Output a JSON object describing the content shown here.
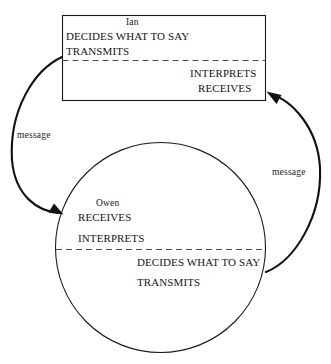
{
  "diagram": {
    "type": "communication-cycle",
    "background_color": "#ffffff",
    "line_color": "#1a1a1a",
    "text_color": "#141414"
  },
  "sender_box": {
    "shape": "rectangle",
    "person_name": "Ian",
    "upper_half": {
      "actions": [
        "DECIDES WHAT TO SAY",
        "TRANSMITS"
      ]
    },
    "lower_half": {
      "actions": [
        "INTERPRETS",
        "RECEIVES"
      ]
    },
    "divider": "dashed"
  },
  "receiver_circle": {
    "shape": "circle",
    "person_name": "Owen",
    "upper_half": {
      "actions": [
        "RECEIVES",
        "INTERPRETS"
      ]
    },
    "lower_half": {
      "actions": [
        "DECIDES WHAT TO SAY",
        "TRANSMITS"
      ]
    },
    "divider": "dashed"
  },
  "arrows": {
    "left": {
      "label": "message",
      "from": "Ian transmits",
      "to": "Owen receives",
      "direction": "downward"
    },
    "right": {
      "label": "message",
      "from": "Owen transmits",
      "to": "Ian receives",
      "direction": "upward"
    }
  }
}
